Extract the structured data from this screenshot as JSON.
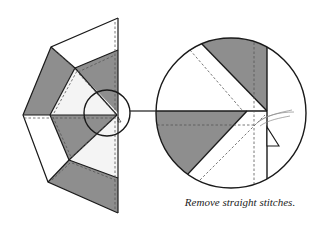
{
  "figure": {
    "caption": "Remove straight stitches.",
    "colors": {
      "fabric_dark": "#8e8e8e",
      "fabric_light": "#ffffff",
      "outline": "#1a1a1a",
      "stitch_line": "#555555",
      "thread": "#888888"
    },
    "left_panel": {
      "description": "Half of a pieced star block with dark and light fabric wedges, dashed stitching lines",
      "detail_circle": {
        "cx": 107,
        "cy": 113,
        "r": 23
      }
    },
    "right_panel": {
      "description": "Magnified detail of block center showing seams, stitch lines, and loose thread",
      "circle": {
        "cx": 231,
        "cy": 113,
        "r": 75
      }
    }
  }
}
